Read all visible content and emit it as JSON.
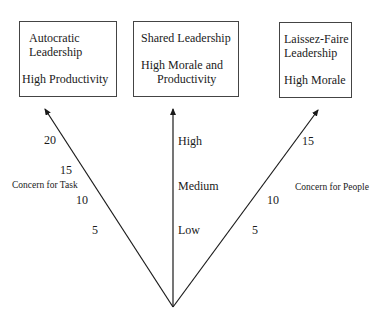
{
  "boxes": {
    "autocratic": {
      "title_line1": "Autocratic",
      "title_line2": "Leadership",
      "outcome": "High Productivity"
    },
    "shared": {
      "title": "Shared Leadership",
      "outcome_line1": "High Morale and",
      "outcome_line2": "Productivity"
    },
    "laissez_faire": {
      "title_line1": "Laissez-Faire",
      "title_line2": "Leadership",
      "outcome": "High Morale"
    }
  },
  "axes": {
    "task": {
      "label": "Concern for Task",
      "ticks": [
        "5",
        "10",
        "15",
        "20"
      ]
    },
    "leadership": {
      "ticks": [
        "Low",
        "Medium",
        "High"
      ]
    },
    "people": {
      "label": "Concern for People",
      "ticks": [
        "5",
        "10",
        "15"
      ]
    }
  },
  "colors": {
    "line": "#1a1a1a",
    "box_border": "#444444",
    "background": "#ffffff"
  }
}
